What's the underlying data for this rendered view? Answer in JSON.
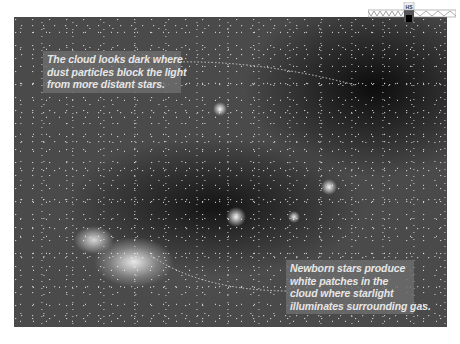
{
  "image": {
    "subject": "dark nebula star field photograph",
    "icon": "truss-bridge-icon",
    "icon_label": "HS"
  },
  "callouts": {
    "top": {
      "lines": [
        "The cloud looks dark where",
        "dust particles block the light",
        "from more distant stars."
      ]
    },
    "bottom": {
      "lines": [
        "Newborn stars produce",
        "white patches in the",
        "cloud where starlight",
        "illuminates surrounding gas."
      ]
    }
  },
  "colors": {
    "callout_bg": "#6e6e6e",
    "callout_text": "#e6e6e6",
    "leader_line": "#cfcfcf"
  }
}
